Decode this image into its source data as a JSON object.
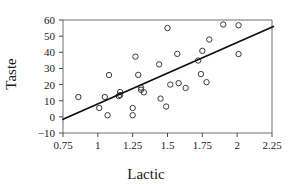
{
  "chart_data": {
    "type": "scatter",
    "title": "",
    "xlabel": "Lactic",
    "ylabel": "Taste",
    "xlim": [
      0.75,
      2.25
    ],
    "ylim": [
      -10,
      60
    ],
    "xticks": [
      0.75,
      1,
      1.25,
      1.5,
      1.75,
      2,
      2.25
    ],
    "xtick_labels": [
      "0.75",
      "1",
      "1.25",
      "1.5",
      "1.75",
      "2",
      "2.25"
    ],
    "yticks": [
      -10,
      0,
      10,
      20,
      30,
      40,
      50,
      60
    ],
    "ytick_labels": [
      "−10",
      "0",
      "10",
      "20",
      "30",
      "40",
      "50",
      "60"
    ],
    "grid": false,
    "legend": null,
    "marker": "open-circle",
    "marker_color": "#3a3a3a",
    "line_color": "#111111",
    "points": [
      {
        "x": 0.86,
        "y": 12.3
      },
      {
        "x": 1.05,
        "y": 12.3
      },
      {
        "x": 1.01,
        "y": 5.5
      },
      {
        "x": 1.07,
        "y": 1.0
      },
      {
        "x": 1.08,
        "y": 25.9
      },
      {
        "x": 1.16,
        "y": 15.4
      },
      {
        "x": 1.16,
        "y": 13.5
      },
      {
        "x": 1.15,
        "y": 12.9
      },
      {
        "x": 1.25,
        "y": 5.5
      },
      {
        "x": 1.25,
        "y": 1.0
      },
      {
        "x": 1.27,
        "y": 37.3
      },
      {
        "x": 1.29,
        "y": 26.0
      },
      {
        "x": 1.31,
        "y": 18.1
      },
      {
        "x": 1.31,
        "y": 16.8
      },
      {
        "x": 1.33,
        "y": 15.2
      },
      {
        "x": 1.44,
        "y": 32.5
      },
      {
        "x": 1.45,
        "y": 11.3
      },
      {
        "x": 1.49,
        "y": 6.4
      },
      {
        "x": 1.5,
        "y": 55.0
      },
      {
        "x": 1.52,
        "y": 20.0
      },
      {
        "x": 1.57,
        "y": 39.0
      },
      {
        "x": 1.58,
        "y": 20.9
      },
      {
        "x": 1.63,
        "y": 17.9
      },
      {
        "x": 1.72,
        "y": 34.9
      },
      {
        "x": 1.74,
        "y": 26.5
      },
      {
        "x": 1.75,
        "y": 40.9
      },
      {
        "x": 1.78,
        "y": 21.5
      },
      {
        "x": 1.8,
        "y": 47.9
      },
      {
        "x": 1.9,
        "y": 57.2
      },
      {
        "x": 2.01,
        "y": 56.7
      },
      {
        "x": 2.01,
        "y": 38.9
      }
    ],
    "fit_line": {
      "x_start": 0.75,
      "y_start": -1.5,
      "x_end": 2.26,
      "y_end": 56.0
    }
  }
}
